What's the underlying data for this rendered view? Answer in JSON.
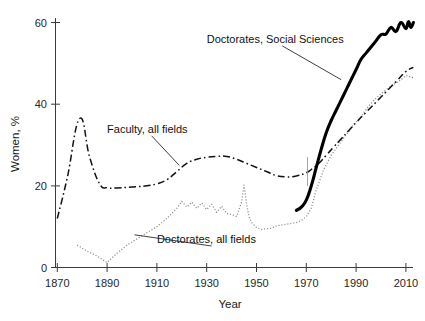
{
  "chart_data": {
    "type": "line",
    "title": "",
    "xlabel": "Year",
    "ylabel": "Women, %",
    "xlim": [
      1866,
      2022
    ],
    "ylim": [
      0,
      63
    ],
    "grid": false,
    "legend_position": "inline-annotations",
    "xticks": [
      1870,
      1890,
      1910,
      1930,
      1950,
      1970,
      1990,
      2010
    ],
    "xtick_labels": [
      "1870",
      "1890",
      "1910",
      "1930",
      "1950",
      "1970",
      "1990",
      "2010"
    ],
    "yticks": [
      0,
      20,
      40,
      60
    ],
    "ytick_labels": [
      "0",
      "20",
      "40",
      "60"
    ],
    "series": [
      {
        "name": "Faculty, all fields",
        "style": "dash-dot",
        "color": "#111111",
        "x": [
          1870,
          1874,
          1879,
          1883,
          1887,
          1890,
          1894,
          1900,
          1906,
          1910,
          1914,
          1918,
          1922,
          1926,
          1930,
          1934,
          1938,
          1942,
          1946,
          1950,
          1954,
          1958,
          1962,
          1966,
          1970,
          1972,
          1975,
          1978,
          1981,
          1984,
          1987,
          1990,
          1994,
          1998,
          2002,
          2006,
          2010,
          2013
        ],
        "values": [
          12.0,
          22.0,
          36.5,
          27.0,
          20.5,
          19.5,
          19.5,
          19.7,
          20.0,
          20.5,
          21.5,
          23.5,
          25.5,
          26.5,
          27.0,
          27.2,
          27.2,
          26.5,
          25.5,
          24.5,
          23.5,
          22.5,
          22.2,
          22.4,
          23.2,
          24.0,
          25.5,
          27.5,
          29.5,
          31.5,
          33.5,
          35.5,
          38.0,
          40.5,
          43.0,
          45.5,
          48.0,
          49.0
        ]
      },
      {
        "name": "Doctorates, all fields",
        "style": "dotted",
        "color": "#8c8c8c",
        "x": [
          1878,
          1882,
          1886,
          1890,
          1894,
          1898,
          1902,
          1906,
          1910,
          1914,
          1918,
          1920,
          1922,
          1924,
          1926,
          1928,
          1930,
          1932,
          1934,
          1936,
          1938,
          1940,
          1942,
          1944,
          1945,
          1946,
          1947,
          1948,
          1950,
          1952,
          1954,
          1956,
          1958,
          1960,
          1962,
          1964,
          1966,
          1968,
          1970,
          1972,
          1974,
          1977,
          1980,
          1983,
          1986,
          1989,
          1992,
          1995,
          1998,
          2001,
          2004,
          2007,
          2010,
          2013
        ],
        "values": [
          5.5,
          4.0,
          2.8,
          1.2,
          3.5,
          5.5,
          7.0,
          8.5,
          10.0,
          12.0,
          14.5,
          16.2,
          14.8,
          16.0,
          14.5,
          15.8,
          14.2,
          15.5,
          13.5,
          15.0,
          13.2,
          13.0,
          12.5,
          16.0,
          20.2,
          15.5,
          12.5,
          11.0,
          9.8,
          9.3,
          9.5,
          9.6,
          10.2,
          10.4,
          10.6,
          10.8,
          11.0,
          11.5,
          12.5,
          14.5,
          19.0,
          24.0,
          27.5,
          30.0,
          32.5,
          35.0,
          37.0,
          39.5,
          41.5,
          43.0,
          44.5,
          45.5,
          47.0,
          46.5
        ]
      },
      {
        "name": "Doctorates, Social Sciences",
        "style": "solid-thick",
        "color": "#000000",
        "x": [
          1966,
          1968,
          1970,
          1972,
          1974,
          1976,
          1978,
          1980,
          1982,
          1984,
          1986,
          1988,
          1990,
          1992,
          1994,
          1996,
          1998,
          2000,
          2002,
          2004,
          2006,
          2008,
          2010,
          2011,
          2012,
          2013
        ],
        "values": [
          14.0,
          14.8,
          16.5,
          20.0,
          24.5,
          29.0,
          33.0,
          36.0,
          38.5,
          41.0,
          43.5,
          46.0,
          48.5,
          51.0,
          52.5,
          54.0,
          55.5,
          57.0,
          57.2,
          58.8,
          57.8,
          60.0,
          58.5,
          60.2,
          58.8,
          60.0
        ]
      }
    ],
    "annotations": [
      {
        "text": "Doctorates, Social Sciences",
        "x": 1930,
        "y": 55,
        "leader_to_x": 1984,
        "leader_to_y": 46
      },
      {
        "text": "Faculty, all fields",
        "x": 1890,
        "y": 33,
        "leader_to_x": 1919,
        "leader_to_y": 25
      },
      {
        "text": "Doctorates, all fields",
        "x": 1910,
        "y": 6,
        "leader_to_x": 1901,
        "leader_to_y": 8
      }
    ]
  },
  "axes": {
    "y_title": "Women, %",
    "x_title": "Year"
  }
}
